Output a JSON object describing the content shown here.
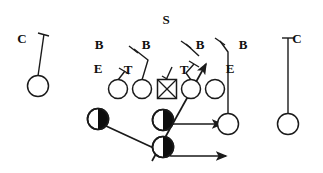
{
  "diagram": {
    "type": "football-play-diagram",
    "width": 323,
    "height": 173,
    "background_color": "#ffffff",
    "ink_color": "#1a1a1a"
  },
  "labels": [
    {
      "id": "cornerback-left",
      "text": "C",
      "x": 22,
      "y": 38
    },
    {
      "id": "safety",
      "text": "S",
      "x": 166,
      "y": 19
    },
    {
      "id": "backer-1",
      "text": "B",
      "x": 99,
      "y": 44
    },
    {
      "id": "backer-2",
      "text": "B",
      "x": 146,
      "y": 44
    },
    {
      "id": "backer-3",
      "text": "B",
      "x": 200,
      "y": 44
    },
    {
      "id": "backer-4",
      "text": "B",
      "x": 243,
      "y": 44
    },
    {
      "id": "end-left",
      "text": "E",
      "x": 98,
      "y": 68
    },
    {
      "id": "tackle-left",
      "text": "T",
      "x": 128,
      "y": 69
    },
    {
      "id": "tackle-right",
      "text": "T",
      "x": 184,
      "y": 69
    },
    {
      "id": "end-right",
      "text": "E",
      "x": 230,
      "y": 68
    },
    {
      "id": "cornerback-right",
      "text": "C",
      "x": 297,
      "y": 38
    }
  ],
  "offense": {
    "linemen": [
      {
        "id": "lineman-left-tackle",
        "shape": "circle",
        "cx": 118,
        "cy": 89,
        "r": 9.5
      },
      {
        "id": "lineman-left-guard",
        "shape": "circle",
        "cx": 142,
        "cy": 89,
        "r": 9.5
      },
      {
        "id": "center",
        "shape": "square-x",
        "cx": 167,
        "cy": 89,
        "size": 19
      },
      {
        "id": "lineman-right-guard",
        "shape": "circle",
        "cx": 191,
        "cy": 89,
        "r": 9.5
      },
      {
        "id": "lineman-right-tackle",
        "shape": "circle",
        "cx": 215,
        "cy": 89,
        "r": 9.5
      }
    ],
    "backs": [
      {
        "id": "back-left",
        "shape": "half-filled-circle",
        "cx": 98,
        "cy": 119,
        "r": 10.5
      },
      {
        "id": "back-middle",
        "shape": "half-filled-circle",
        "cx": 163,
        "cy": 120,
        "r": 10.5
      },
      {
        "id": "back-deep",
        "shape": "half-filled-circle",
        "cx": 163,
        "cy": 147,
        "r": 10.5
      }
    ],
    "receiver": {
      "id": "receiver-right",
      "shape": "circle",
      "cx": 228,
      "cy": 124,
      "r": 10.5
    }
  },
  "routes": [
    {
      "id": "route-back-middle-right",
      "end": "arrow",
      "points": "163,124 224,124"
    },
    {
      "id": "route-back-left-sweep",
      "end": "arrow",
      "points": "106,126 170,156 229,156"
    },
    {
      "id": "route-back-deep-slant",
      "end": "arrow",
      "points": "152,160 208,62"
    }
  ],
  "coverage_assignments": [
    {
      "id": "assign-cornerback-left",
      "end": "tick-perp",
      "points": "38,76 44,34"
    },
    {
      "id": "assign-cornerback-right",
      "end": "tick-perp",
      "points": "288,114 288,38"
    },
    {
      "id": "assign-end-left",
      "end": "tick-perp",
      "points": "118,81 124,72"
    },
    {
      "id": "assign-tackle-left",
      "end": "tick-perp",
      "points": "142,81 147,60 134,50"
    },
    {
      "id": "assign-backer-2-stem",
      "end": "tick-perp",
      "points": "166,80 172,66 160,47"
    },
    {
      "id": "assign-tackle-right",
      "end": "tick-perp",
      "points": "191,81 186,73 193,62"
    },
    {
      "id": "assign-backer-4-stem",
      "end": "tick-perp",
      "points": "228,114 228,54 220,41"
    }
  ]
}
